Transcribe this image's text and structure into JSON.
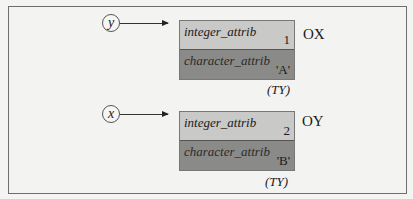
{
  "objects": [
    {
      "reference": "y",
      "object_id": "OX",
      "type_label": "(TY)",
      "attributes": [
        {
          "name": "integer_attrib",
          "value": "1"
        },
        {
          "name": "character_attrib",
          "value": "'A'"
        }
      ]
    },
    {
      "reference": "x",
      "object_id": "OY",
      "type_label": "(TY)",
      "attributes": [
        {
          "name": "integer_attrib",
          "value": "2"
        },
        {
          "name": "character_attrib",
          "value": "'B'"
        }
      ]
    }
  ],
  "colors": {
    "integer_row": "#c9c9c7",
    "character_row": "#8a8a88",
    "frame": "#6e6e6e"
  }
}
